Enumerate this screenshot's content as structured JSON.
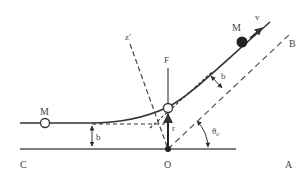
{
  "diagram": {
    "labels": {
      "particle_initial": "M",
      "particle_final": "M",
      "velocity": "v",
      "asymptote_out": "B",
      "axis_z": "z′",
      "force": "F",
      "impact_param_in": "b",
      "impact_param_out": "b",
      "radius": "r",
      "angle": "θ",
      "angle_sub": "c",
      "point_c": "C",
      "origin": "O",
      "point_a": "A"
    },
    "colors": {
      "line": "#444444",
      "background": "#ffffff"
    }
  }
}
